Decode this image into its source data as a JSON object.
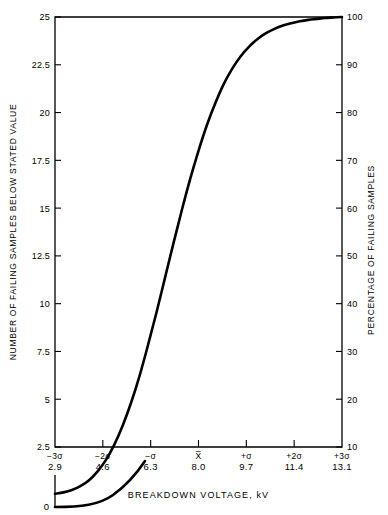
{
  "chart_data": {
    "type": "line",
    "title": "",
    "xlabel": "BREAKDOWN VOLTAGE, kV",
    "ylabel": "NUMBER OF FAILING SAMPLES BELOW STATED VALUE",
    "ylabel_right": "PERCENTAGE OF FAILING SAMPLES",
    "grid": false,
    "legend": "none",
    "xlim": [
      2.9,
      13.1
    ],
    "ylim": [
      2.5,
      25
    ],
    "ylim_right": [
      10,
      100
    ],
    "x_ticks": [
      {
        "sigma": "−3σ",
        "value": "2.9",
        "x": 2.9
      },
      {
        "sigma": "−2σ",
        "value": "4.6",
        "x": 4.6
      },
      {
        "sigma": "−σ",
        "value": "6.3",
        "x": 6.3
      },
      {
        "sigma": "X̅",
        "value": "8.0",
        "x": 8.0
      },
      {
        "sigma": "+σ",
        "value": "9.7",
        "x": 9.7
      },
      {
        "sigma": "+2σ",
        "value": "11.4",
        "x": 11.4
      },
      {
        "sigma": "+3σ",
        "value": "13.1",
        "x": 13.1
      }
    ],
    "y_ticks_left": [
      "25",
      "22.5",
      "20",
      "17.5",
      "15",
      "12.5",
      "10",
      "7.5",
      "5",
      "2.5"
    ],
    "y_ticks_left_values": [
      25,
      22.5,
      20,
      17.5,
      15,
      12.5,
      10,
      7.5,
      5,
      2.5
    ],
    "y_ticks_right": [
      "100",
      "90",
      "80",
      "70",
      "60",
      "50",
      "40",
      "30",
      "20",
      "10"
    ],
    "y_ticks_right_values": [
      100,
      90,
      80,
      70,
      60,
      50,
      40,
      30,
      20,
      10
    ],
    "zero_label": "0",
    "series": [
      {
        "name": "cumulative breakdown distribution",
        "x": [
          2.9,
          3.2,
          3.5,
          3.8,
          4.1,
          4.4,
          4.7,
          5.0,
          5.3,
          5.6,
          5.9,
          6.2,
          6.5,
          6.8,
          7.1,
          7.4,
          7.7,
          8.0,
          8.3,
          8.6,
          8.9,
          9.2,
          9.5,
          9.8,
          10.1,
          10.4,
          10.7,
          11.0,
          11.3,
          11.6,
          11.9,
          12.2,
          12.5,
          12.8,
          13.1
        ],
        "y_percent": [
          0.2,
          0.5,
          1.0,
          1.8,
          3.0,
          4.8,
          7.2,
          10.4,
          14.4,
          19.2,
          24.8,
          31.2,
          38.0,
          45.2,
          52.4,
          59.4,
          66.0,
          72.0,
          77.4,
          82.0,
          86.0,
          89.2,
          91.8,
          93.8,
          95.4,
          96.6,
          97.5,
          98.2,
          98.7,
          99.1,
          99.4,
          99.6,
          99.8,
          99.9,
          100.0
        ]
      }
    ]
  }
}
